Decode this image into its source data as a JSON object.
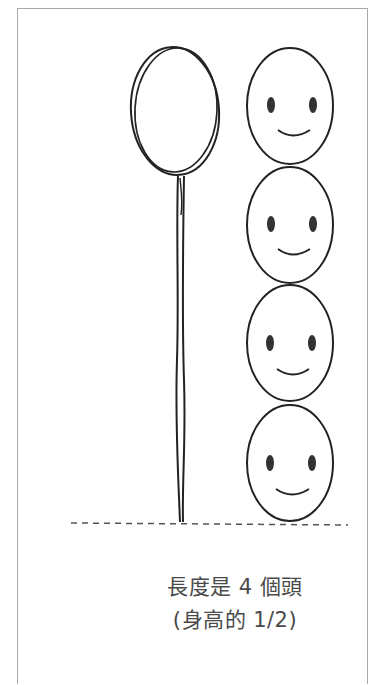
{
  "diagram": {
    "caption_line1": "長度是 4 個頭",
    "caption_line2": "(身高的 1/2)",
    "elements": {
      "stick_figure": "oval head on a long stick, length equal to 4 heads",
      "heads": [
        "smiley-face",
        "smiley-face",
        "smiley-face",
        "smiley-face"
      ],
      "head_count": 4,
      "baseline": "dashed ground line"
    },
    "colors": {
      "line": "#222222",
      "text": "#4a4a4a",
      "border": "#a9a9a9",
      "dash": "#555555"
    }
  }
}
